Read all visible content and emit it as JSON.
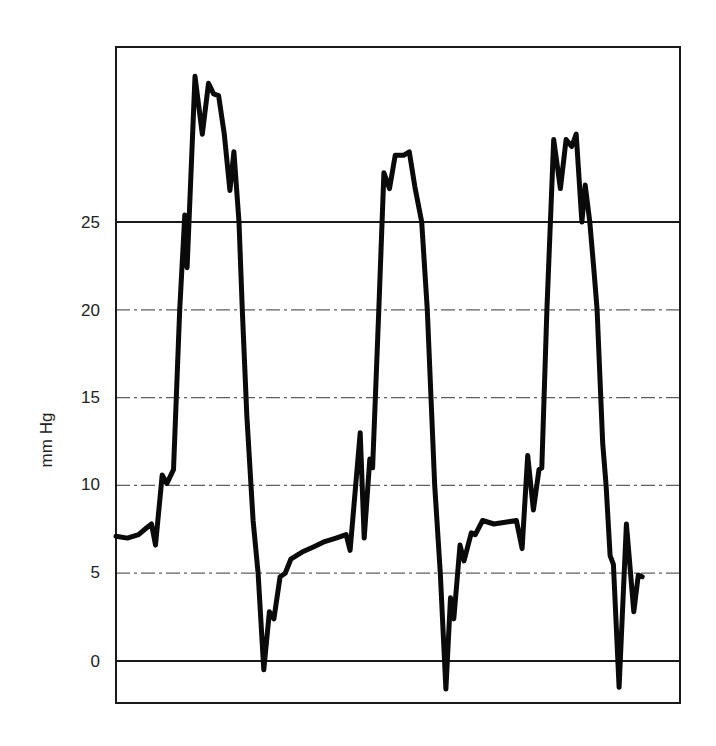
{
  "chart_data": {
    "type": "line",
    "title": "",
    "xlabel": "",
    "ylabel": "mm Hg",
    "ylim": [
      -2,
      34
    ],
    "yticks": [
      0,
      5,
      10,
      15,
      20,
      25
    ],
    "grid": {
      "solid_lines_at": [
        0,
        25
      ],
      "dashed_lines_at": [
        5,
        10,
        15,
        20
      ]
    },
    "legend": null,
    "series": [
      {
        "name": "pressure",
        "x_unit": "relative time (0-100, unlabeled)",
        "points": [
          [
            0,
            7.1
          ],
          [
            2,
            7.0
          ],
          [
            4,
            7.2
          ],
          [
            5.5,
            7.6
          ],
          [
            6.3,
            7.8
          ],
          [
            7.0,
            6.6
          ],
          [
            8.2,
            10.6
          ],
          [
            9.0,
            10.1
          ],
          [
            10.2,
            10.9
          ],
          [
            11.3,
            20
          ],
          [
            12.2,
            25.4
          ],
          [
            12.6,
            22.4
          ],
          [
            14.0,
            33.3
          ],
          [
            15.3,
            30.0
          ],
          [
            16.4,
            32.9
          ],
          [
            17.3,
            32.3
          ],
          [
            18.2,
            32.2
          ],
          [
            19.2,
            30.0
          ],
          [
            20.2,
            26.8
          ],
          [
            20.9,
            29.0
          ],
          [
            21.8,
            25.0
          ],
          [
            22.4,
            20.0
          ],
          [
            23.2,
            14.0
          ],
          [
            24.3,
            8.0
          ],
          [
            25.2,
            5.0
          ],
          [
            26.2,
            -0.5
          ],
          [
            27.2,
            2.8
          ],
          [
            28.0,
            2.4
          ],
          [
            29.1,
            4.8
          ],
          [
            30.0,
            5.0
          ],
          [
            31.0,
            5.8
          ],
          [
            33.0,
            6.2
          ],
          [
            35.0,
            6.5
          ],
          [
            37.0,
            6.8
          ],
          [
            39.0,
            7.0
          ],
          [
            40.8,
            7.2
          ],
          [
            41.5,
            6.3
          ],
          [
            43.3,
            13.0
          ],
          [
            44.0,
            7.0
          ],
          [
            45.0,
            11.5
          ],
          [
            45.5,
            11.0
          ],
          [
            46.6,
            20.0
          ],
          [
            47.5,
            27.8
          ],
          [
            48.5,
            26.9
          ],
          [
            49.5,
            28.8
          ],
          [
            51.0,
            28.8
          ],
          [
            52.0,
            29.0
          ],
          [
            53.0,
            27.0
          ],
          [
            54.2,
            25.0
          ],
          [
            55.2,
            20.0
          ],
          [
            56.5,
            10.0
          ],
          [
            57.5,
            5.0
          ],
          [
            58.5,
            -1.6
          ],
          [
            59.3,
            3.6
          ],
          [
            59.9,
            2.4
          ],
          [
            61.0,
            6.6
          ],
          [
            61.7,
            5.7
          ],
          [
            63.0,
            7.3
          ],
          [
            63.7,
            7.2
          ],
          [
            65.0,
            8.0
          ],
          [
            67.0,
            7.8
          ],
          [
            69.0,
            7.9
          ],
          [
            71.0,
            8.0
          ],
          [
            72.0,
            6.4
          ],
          [
            73.0,
            11.7
          ],
          [
            74.0,
            8.6
          ],
          [
            75.0,
            10.9
          ],
          [
            75.5,
            11.0
          ],
          [
            76.4,
            20.0
          ],
          [
            77.6,
            29.7
          ],
          [
            78.8,
            26.9
          ],
          [
            79.8,
            29.7
          ],
          [
            80.8,
            29.3
          ],
          [
            81.6,
            30.0
          ],
          [
            82.6,
            25.0
          ],
          [
            83.2,
            27.1
          ],
          [
            84.0,
            25.0
          ],
          [
            84.8,
            22.0
          ],
          [
            85.3,
            20.0
          ],
          [
            86.3,
            12.4
          ],
          [
            86.9,
            10.0
          ],
          [
            87.6,
            6.0
          ],
          [
            88.2,
            5.5
          ],
          [
            89.2,
            -1.5
          ],
          [
            90.5,
            7.8
          ],
          [
            91.8,
            2.8
          ],
          [
            92.6,
            4.9
          ],
          [
            93.3,
            4.8
          ]
        ]
      }
    ],
    "frame": {
      "x_min_px": 116,
      "x_max_px": 680,
      "y_top_px": 47,
      "y_bottom_px": 703
    }
  },
  "axis": {
    "ylabel": "mm Hg",
    "ticks": [
      {
        "value": 25,
        "label": "25"
      },
      {
        "value": 20,
        "label": "20"
      },
      {
        "value": 15,
        "label": "15"
      },
      {
        "value": 10,
        "label": "10"
      },
      {
        "value": 5,
        "label": "5"
      },
      {
        "value": 0,
        "label": "0"
      }
    ]
  },
  "colors": {
    "line": "#0a0a0a",
    "grid": "#2a2a2a",
    "frame": "#1a1a1a",
    "text": "#222222",
    "background": "#ffffff"
  }
}
